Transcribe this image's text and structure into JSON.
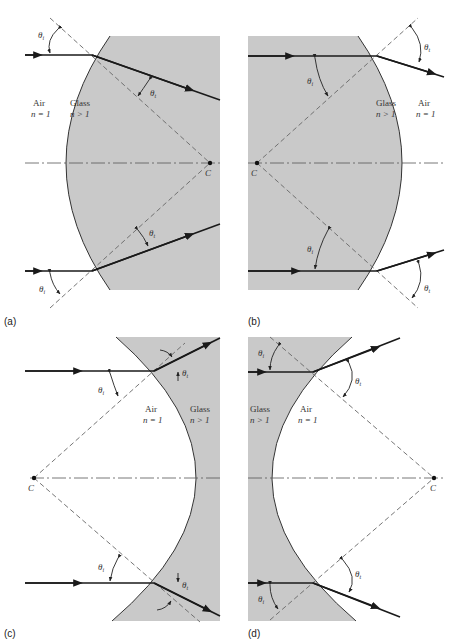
{
  "figure": {
    "colors": {
      "glass": "#c9c9c9",
      "ray": "#1a1a1a",
      "background": "#ffffff"
    },
    "panels": [
      {
        "id": "a",
        "caption": "(a)",
        "left_medium": {
          "name": "Air",
          "index": "n = 1"
        },
        "right_medium": {
          "name": "Glass",
          "index": "n > 1"
        },
        "surface": "convex",
        "center_label": "C",
        "incident_angle_label": "θi",
        "transmitted_angle_label": "θt"
      },
      {
        "id": "b",
        "caption": "(b)",
        "left_medium": {
          "name": "Glass",
          "index": "n > 1"
        },
        "right_medium": {
          "name": "Air",
          "index": "n = 1"
        },
        "surface": "convex",
        "center_label": "C",
        "incident_angle_label": "θi",
        "transmitted_angle_label": "θt"
      },
      {
        "id": "c",
        "caption": "(c)",
        "left_medium": {
          "name": "Air",
          "index": "n = 1"
        },
        "right_medium": {
          "name": "Glass",
          "index": "n > 1"
        },
        "surface": "concave",
        "center_label": "C",
        "incident_angle_label": "θi",
        "transmitted_angle_label": "θt"
      },
      {
        "id": "d",
        "caption": "(d)",
        "left_medium": {
          "name": "Glass",
          "index": "n > 1"
        },
        "right_medium": {
          "name": "Air",
          "index": "n = 1"
        },
        "surface": "concave",
        "center_label": "C",
        "incident_angle_label": "θi",
        "transmitted_angle_label": "θt"
      }
    ]
  },
  "labels": {
    "theta": "θ",
    "sub_i": "i",
    "sub_t": "t"
  }
}
